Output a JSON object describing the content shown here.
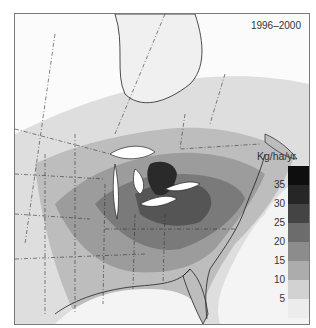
{
  "map": {
    "title": "1996–2000",
    "subject": "Nitrogen deposition, eastern North America",
    "legend": {
      "unit": "Kg/ha/yr",
      "ticks": [
        "35",
        "30",
        "25",
        "20",
        "15",
        "10",
        "5"
      ],
      "bins": [
        {
          "range": ">35",
          "color": "#0e0e0e"
        },
        {
          "range": "30-35",
          "color": "#262626"
        },
        {
          "range": "25-30",
          "color": "#444444"
        },
        {
          "range": "20-25",
          "color": "#6c6c6c"
        },
        {
          "range": "15-20",
          "color": "#8c8c8c"
        },
        {
          "range": "10-15",
          "color": "#acacac"
        },
        {
          "range": "5-10",
          "color": "#d2d2d2"
        },
        {
          "range": "<5",
          "color": "#ececec"
        }
      ]
    }
  }
}
